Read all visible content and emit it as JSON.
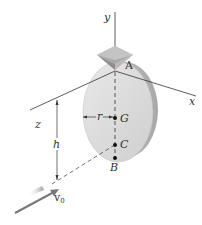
{
  "diagram": {
    "type": "physics-rigid-body",
    "colors": {
      "line": "#333333",
      "disk_face": "#dcdcdc",
      "disk_edge": "#b8b8b8",
      "support": "#9a9a9a",
      "arrow": "#777777"
    },
    "axes": {
      "y": "y",
      "x": "x",
      "z": "z"
    },
    "points": {
      "A": "A",
      "G": "G",
      "C": "C",
      "B": "B"
    },
    "dimensions": {
      "r": "r",
      "h": "h"
    },
    "projectile": {
      "velocity_label": "v",
      "velocity_subscript": "0"
    }
  }
}
